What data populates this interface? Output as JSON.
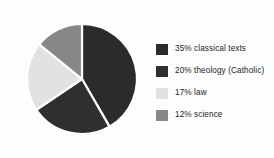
{
  "chart_data": {
    "type": "pie",
    "title": "",
    "subtitle": "",
    "xlabel": "",
    "ylabel": "",
    "legend_position": "right",
    "grid": false,
    "start_angle_deg": 0,
    "direction": "clockwise",
    "categories": [
      "classical texts",
      "theology (Catholic)",
      "law",
      "science"
    ],
    "values": [
      35,
      20,
      17,
      12
    ],
    "value_unit": "%",
    "colors": [
      "#2b2b2b",
      "#2f2f2f",
      "#e2e2e2",
      "#878787"
    ],
    "slices": [
      {
        "label": "classical texts",
        "value": 35,
        "display": "35% classical texts",
        "color": "#2b2b2b",
        "start_deg": 0,
        "sweep_deg": 150
      },
      {
        "label": "theology (Catholic)",
        "value": 20,
        "display": "20% theology (Catholic)",
        "color": "#2f2f2f",
        "start_deg": 150,
        "sweep_deg": 86
      },
      {
        "label": "law",
        "value": 17,
        "display": "17% law",
        "color": "#e2e2e2",
        "start_deg": 236,
        "sweep_deg": 73
      },
      {
        "label": "science",
        "value": 12,
        "display": "12% science",
        "color": "#878787",
        "start_deg": 309,
        "sweep_deg": 51
      }
    ]
  },
  "legend": {
    "items": [
      {
        "swatch_name": "legend-swatch-classical-texts",
        "text": "35% classical texts",
        "color": "#2b2b2b"
      },
      {
        "swatch_name": "legend-swatch-theology",
        "text": "20% theology (Catholic)",
        "color": "#2f2f2f"
      },
      {
        "swatch_name": "legend-swatch-law",
        "text": "17% law",
        "color": "#e2e2e2"
      },
      {
        "swatch_name": "legend-swatch-science",
        "text": "12% science",
        "color": "#878787"
      }
    ]
  },
  "style": {
    "background": "#fdfdfd",
    "slice_gap_color": "#ffffff",
    "text_color": "#232323"
  }
}
